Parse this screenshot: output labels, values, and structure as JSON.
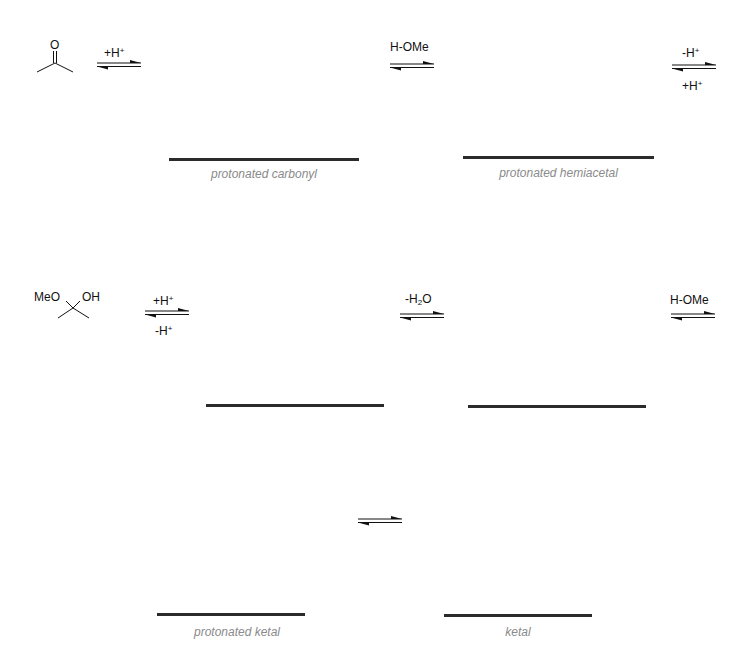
{
  "diagram": {
    "molecules": {
      "acetone": {
        "atoms": [
          "O"
        ]
      },
      "hemiacetal": {
        "left_group": "MeO",
        "right_group": "OH"
      }
    },
    "arrows": [
      {
        "id": "step1",
        "top": "+H",
        "top_sup": "+",
        "bottom": ""
      },
      {
        "id": "step2",
        "top": "H-OMe",
        "bottom": ""
      },
      {
        "id": "step3",
        "top": "-H",
        "top_sup": "+",
        "bottom": "+H",
        "bottom_sup": "+"
      },
      {
        "id": "step4",
        "top": "+H",
        "top_sup": "+",
        "bottom": "-H",
        "bottom_sup": "+"
      },
      {
        "id": "step5",
        "top_pre": "-H",
        "top_sub": "2",
        "top_post": "O",
        "bottom": ""
      },
      {
        "id": "step6",
        "top": "H-OMe",
        "bottom": ""
      },
      {
        "id": "step7",
        "top": "",
        "bottom": ""
      }
    ],
    "placeholders": [
      {
        "label": "protonated carbonyl"
      },
      {
        "label": "protonated hemiacetal"
      },
      {
        "label": ""
      },
      {
        "label": ""
      },
      {
        "label": "protonated ketal"
      },
      {
        "label": "ketal"
      }
    ],
    "colors": {
      "bar": "#2b2b2b",
      "label": "#8a8a8a",
      "text": "#111111"
    }
  }
}
